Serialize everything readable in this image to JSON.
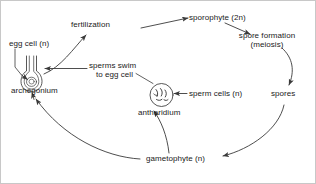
{
  "diagram": {
    "background_color": "#ffffff",
    "line_color": "#3a3a3a",
    "text_color": "#1a1a1a",
    "labels": {
      "egg_cell": "egg cell (n)",
      "archegonium": "archegonium",
      "fertilization": "fertilization",
      "sporophyte": "sporophyte (2n)",
      "spore_formation_line1": "spore formation",
      "spore_formation_line2": "(meiosis)",
      "spores": "spores",
      "gametophyte": "gametophyte (n)",
      "antheridium": "antheridium",
      "sperm_cells": "sperm cells (n)",
      "sperms_swim_line1": "sperms swim",
      "sperms_swim_line2": "to egg cell"
    },
    "structures": [
      {
        "name": "archegonium",
        "shape": "flask-with-neck",
        "description": "flask-shaped venter with long narrow neck containing egg cell"
      },
      {
        "name": "antheridium",
        "shape": "circle-with-sperm",
        "description": "round sac containing comma-shaped sperm cells"
      }
    ],
    "arrows": [
      {
        "from": "archegonium",
        "to": "fertilization",
        "style": "curved"
      },
      {
        "from": "fertilization",
        "to": "sporophyte",
        "style": "straight"
      },
      {
        "from": "sporophyte",
        "to": "spore formation (meiosis)",
        "style": "straight"
      },
      {
        "from": "spore formation (meiosis)",
        "to": "spores",
        "style": "curved"
      },
      {
        "from": "spores",
        "to": "gametophyte",
        "style": "curved"
      },
      {
        "from": "gametophyte",
        "to": "antheridium",
        "style": "curved"
      },
      {
        "from": "gametophyte",
        "to": "archegonium",
        "style": "curved"
      },
      {
        "from": "sperms swim to egg cell",
        "to": "archegonium",
        "style": "straight"
      },
      {
        "from": "antheridium",
        "to": "sperms swim to egg cell",
        "style": "straight"
      },
      {
        "from": "egg cell",
        "to": "archegonium",
        "style": "pointer"
      },
      {
        "from": "sperm cells",
        "to": "antheridium",
        "style": "pointer"
      }
    ]
  }
}
